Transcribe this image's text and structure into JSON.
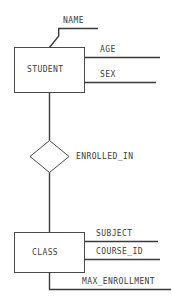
{
  "diagram": {
    "type": "entity-relationship-diagram",
    "background_color": "#ffffff",
    "line_color": "#4a4a4a",
    "text_color": "#3c3c3c",
    "entities": [
      {
        "id": "student",
        "label": "STUDENT",
        "attributes": [
          {
            "id": "name",
            "label": "NAME"
          },
          {
            "id": "age",
            "label": "AGE"
          },
          {
            "id": "sex",
            "label": "SEX"
          }
        ]
      },
      {
        "id": "class",
        "label": "CLASS",
        "attributes": [
          {
            "id": "subject",
            "label": "SUBJECT"
          },
          {
            "id": "course_id",
            "label": "COURSE_ID"
          },
          {
            "id": "max_enrollment",
            "label": "MAX_ENROLLMENT"
          }
        ]
      }
    ],
    "relationships": [
      {
        "id": "enrolled_in",
        "label": "ENROLLED_IN",
        "from": "STUDENT",
        "to": "CLASS"
      }
    ]
  }
}
